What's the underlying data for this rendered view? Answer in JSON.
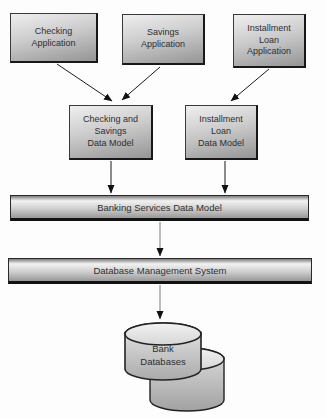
{
  "diagram": {
    "applications": [
      {
        "label": "Checking\nApplication"
      },
      {
        "label": "Savings\nApplication"
      },
      {
        "label": "Installment\nLoan\nApplication"
      }
    ],
    "data_models": [
      {
        "label": "Checking and\nSavings\nData Model"
      },
      {
        "label": "Installment\nLoan\nData Model"
      }
    ],
    "layers": [
      {
        "label": "Banking Services Data Model"
      },
      {
        "label": "Database Management System"
      }
    ],
    "database": {
      "label": "Bank\nDatabases"
    },
    "colors": {
      "box_gradient_light": "#efefef",
      "box_gradient_dark": "#959595",
      "box_border": "#181818",
      "arrow_black": "#1a1a1a",
      "arrow_gray": "#8f8f8f",
      "cylinder_light": "#e9e9e9",
      "cylinder_dark": "#a8a8a8",
      "background": "#fdfdfd"
    }
  }
}
